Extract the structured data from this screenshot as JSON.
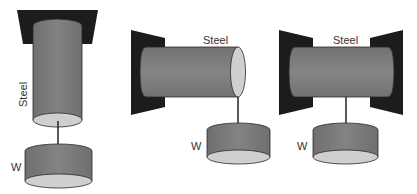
{
  "figures": [
    {
      "id": "vertical-hanging",
      "material_label": "Steel",
      "weight_label": "W"
    },
    {
      "id": "cantilever",
      "material_label": "Steel",
      "weight_label": "W"
    },
    {
      "id": "fixed-both-ends",
      "material_label": "Steel",
      "weight_label": "W"
    }
  ],
  "colors": {
    "support": "#1c1c1c",
    "cylinder_body": "#7a7a7a",
    "cylinder_end": "#cfcfcf",
    "outline": "#2a2a2a",
    "wire": "#222222",
    "text": "#333333"
  }
}
